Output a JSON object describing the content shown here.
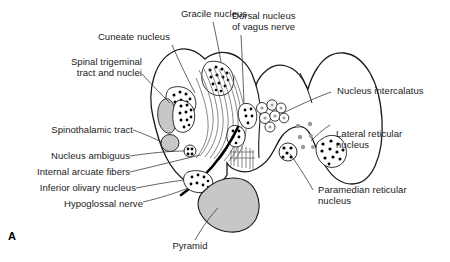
{
  "figure": {
    "panel_letter": "A",
    "type": "anatomical-cross-section",
    "colors": {
      "outline": "#1a1a1a",
      "nerve_tract": "#000000",
      "gray_fill": "#c7c7c7",
      "gray_dot": "#9a9a9a",
      "black_dot": "#000000",
      "background": "#ffffff",
      "label_text": "#1a1a1a"
    }
  },
  "labels": {
    "gracile_nucleus": "Gracile nucleus",
    "cuneate_nucleus": "Cuneate nucleus",
    "spinal_trigeminal_line1": "Spinal trigeminal",
    "spinal_trigeminal_line2": "tract and nuclei",
    "spinothalamic_tract": "Spinothalamic tract",
    "nucleus_ambiguus": "Nucleus ambiguus",
    "internal_arcuate_fibers": "Internal arcuate fibers",
    "inferior_olivary_nucleus": "Inferior olivary nucleus",
    "hypoglossal_nerve": "Hypoglossal nerve",
    "pyramid": "Pyramid",
    "dorsal_vagus_line1": "Dorsal nucleus",
    "dorsal_vagus_line2": "of vagus nerve",
    "nucleus_intercalatus": "Nucleus intercalatus",
    "lateral_reticular_line1": "Lateral reticular",
    "lateral_reticular_line2": "nucleus",
    "paramedian_reticular_line1": "Paramedian reticular",
    "paramedian_reticular_line2": "nucleus"
  }
}
